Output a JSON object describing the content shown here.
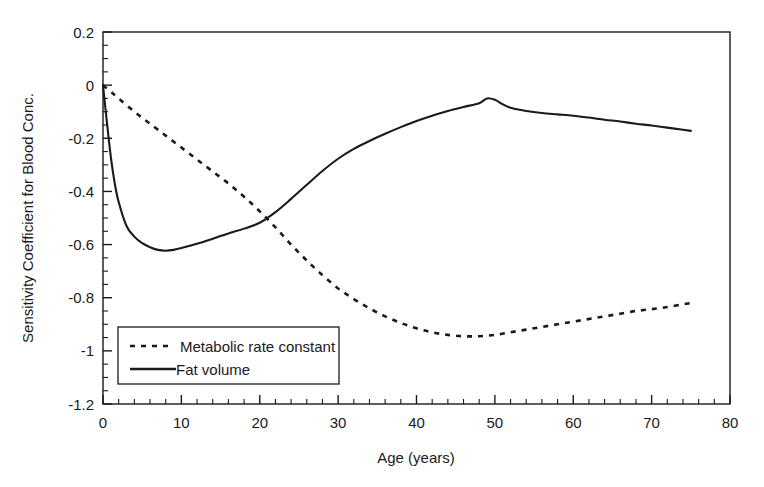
{
  "chart_data": {
    "type": "line",
    "title": "",
    "xlabel": "Age (years)",
    "ylabel": "Sensitivity Coefficient for Blood Conc.",
    "xlim": [
      0,
      80
    ],
    "ylim": [
      -1.2,
      0.2
    ],
    "grid": false,
    "legend_position": "lower left inside",
    "x_ticks_major": [
      0,
      10,
      20,
      30,
      40,
      50,
      60,
      70,
      80
    ],
    "x_tick_labels": [
      "0",
      "10",
      "20",
      "30",
      "40",
      "50",
      "60",
      "70",
      "80"
    ],
    "x_tick_minor_step": 2,
    "y_ticks_major": [
      0.2,
      0,
      -0.2,
      -0.4,
      -0.6,
      -0.8,
      -1,
      -1.2
    ],
    "y_tick_labels": [
      "0.2",
      "0",
      "-0.2",
      "-0.4",
      "-0.6",
      "-0.8",
      "-1",
      "-1.2"
    ],
    "y_tick_minor_step": 0.05,
    "series": [
      {
        "name": "Metabolic rate constant",
        "style": "dashed",
        "color": "#1a1a1a",
        "x": [
          0,
          1,
          2,
          4,
          6,
          8,
          10,
          12,
          14,
          16,
          18,
          20,
          22,
          24,
          26,
          28,
          30,
          32,
          34,
          36,
          38,
          40,
          42,
          44,
          46,
          48,
          50,
          52,
          54,
          56,
          58,
          60,
          62,
          64,
          66,
          68,
          70,
          72,
          74,
          75
        ],
        "values": [
          0,
          -0.025,
          -0.05,
          -0.1,
          -0.145,
          -0.19,
          -0.235,
          -0.28,
          -0.325,
          -0.37,
          -0.42,
          -0.475,
          -0.535,
          -0.6,
          -0.66,
          -0.715,
          -0.765,
          -0.805,
          -0.84,
          -0.87,
          -0.895,
          -0.915,
          -0.93,
          -0.94,
          -0.945,
          -0.945,
          -0.94,
          -0.93,
          -0.92,
          -0.91,
          -0.9,
          -0.89,
          -0.88,
          -0.87,
          -0.86,
          -0.85,
          -0.843,
          -0.835,
          -0.825,
          -0.82
        ]
      },
      {
        "name": "Fat volume",
        "style": "solid",
        "color": "#1a1a1a",
        "x": [
          0,
          0.5,
          1,
          1.5,
          2,
          3,
          4,
          5,
          6,
          7,
          8,
          9,
          10,
          12,
          14,
          16,
          18,
          20,
          22,
          24,
          26,
          28,
          30,
          32,
          34,
          36,
          38,
          40,
          42,
          44,
          46,
          48,
          49,
          50,
          51,
          52,
          54,
          56,
          58,
          60,
          62,
          64,
          66,
          68,
          70,
          72,
          74,
          75
        ],
        "values": [
          0,
          -0.14,
          -0.27,
          -0.37,
          -0.44,
          -0.53,
          -0.57,
          -0.595,
          -0.61,
          -0.62,
          -0.623,
          -0.62,
          -0.613,
          -0.597,
          -0.578,
          -0.558,
          -0.54,
          -0.518,
          -0.478,
          -0.428,
          -0.375,
          -0.323,
          -0.277,
          -0.24,
          -0.21,
          -0.183,
          -0.158,
          -0.135,
          -0.115,
          -0.097,
          -0.082,
          -0.068,
          -0.05,
          -0.055,
          -0.072,
          -0.085,
          -0.097,
          -0.105,
          -0.11,
          -0.115,
          -0.122,
          -0.13,
          -0.137,
          -0.145,
          -0.152,
          -0.16,
          -0.168,
          -0.172
        ]
      }
    ]
  },
  "axes": {
    "y_title": "Sensitivity Coefficient for Blood Conc.",
    "x_title": "Age (years)",
    "y_labels": [
      "0.2",
      "0",
      "-0.2",
      "-0.4",
      "-0.6",
      "-0.8",
      "-1",
      "-1.2"
    ],
    "x_labels": [
      "0",
      "10",
      "20",
      "30",
      "40",
      "50",
      "60",
      "70",
      "80"
    ]
  },
  "legend": {
    "entries": [
      {
        "label": "Metabolic rate constant",
        "style": "dashed"
      },
      {
        "label": "Fat volume",
        "style": "solid"
      }
    ]
  },
  "colors": {
    "ink": "#1a1a1a",
    "background": "#ffffff"
  }
}
